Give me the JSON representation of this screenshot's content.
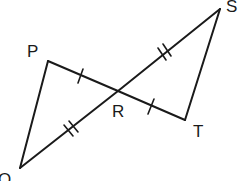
{
  "diagram": {
    "type": "geometry",
    "points": {
      "P": {
        "label": "P",
        "x": 48,
        "y": 61
      },
      "Q": {
        "label": "Q",
        "x": 20,
        "y": 168
      },
      "R": {
        "label": "R",
        "x": 118,
        "y": 91
      },
      "S": {
        "label": "S",
        "x": 220,
        "y": 9
      },
      "T": {
        "label": "T",
        "x": 185,
        "y": 120
      }
    },
    "segments": [
      {
        "from": "P",
        "to": "Q",
        "ticks": 0
      },
      {
        "from": "P",
        "to": "R",
        "ticks": 1
      },
      {
        "from": "R",
        "to": "T",
        "ticks": 1
      },
      {
        "from": "Q",
        "to": "R",
        "ticks": 2
      },
      {
        "from": "R",
        "to": "S",
        "ticks": 2
      },
      {
        "from": "S",
        "to": "T",
        "ticks": 0
      }
    ],
    "congruence_marks": [
      {
        "segments": [
          "PR",
          "RT"
        ],
        "mark": "single-tick"
      },
      {
        "segments": [
          "QR",
          "RS"
        ],
        "mark": "double-tick"
      }
    ],
    "stroke_color": "#1a1a1a",
    "background_color": "#ffffff"
  }
}
